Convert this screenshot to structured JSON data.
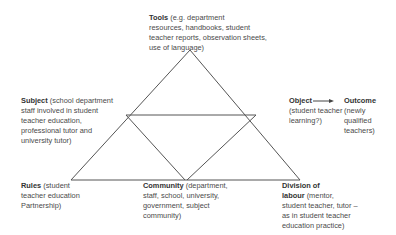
{
  "diagram": {
    "type": "activity-system-triangle",
    "nodes": {
      "tools": {
        "title": "Tools",
        "lines": [
          "(e.g. department",
          "resources, handbooks, student",
          "teacher reports, observation sheets,",
          "use of language)"
        ]
      },
      "subject": {
        "title": "Subject",
        "lines": [
          "(school department",
          "staff involved in student",
          "teacher education,",
          "professional tutor and",
          "university tutor)"
        ]
      },
      "object": {
        "title": "Object",
        "lines": [
          "(student teacher",
          "learning?)"
        ]
      },
      "outcome": {
        "title": "Outcome",
        "lines": [
          "(newly",
          "qualified",
          "teachers)"
        ]
      },
      "rules": {
        "title": "Rules",
        "lines": [
          "(student",
          "teacher education",
          "Partnership)"
        ]
      },
      "community": {
        "title": "Community",
        "lines": [
          "(department,",
          "staff, school, university,",
          "government, subject",
          "community)"
        ]
      },
      "division": {
        "title": "Division of",
        "title2": "labour",
        "lines": [
          "(mentor,",
          "student teacher, tutor –",
          "as in student teacher",
          "education  practice)"
        ]
      }
    },
    "edges": [
      {
        "from": "object",
        "to": "outcome",
        "type": "arrow"
      }
    ],
    "colors": {
      "line": "#555555",
      "text": "#4a4a4a"
    }
  }
}
